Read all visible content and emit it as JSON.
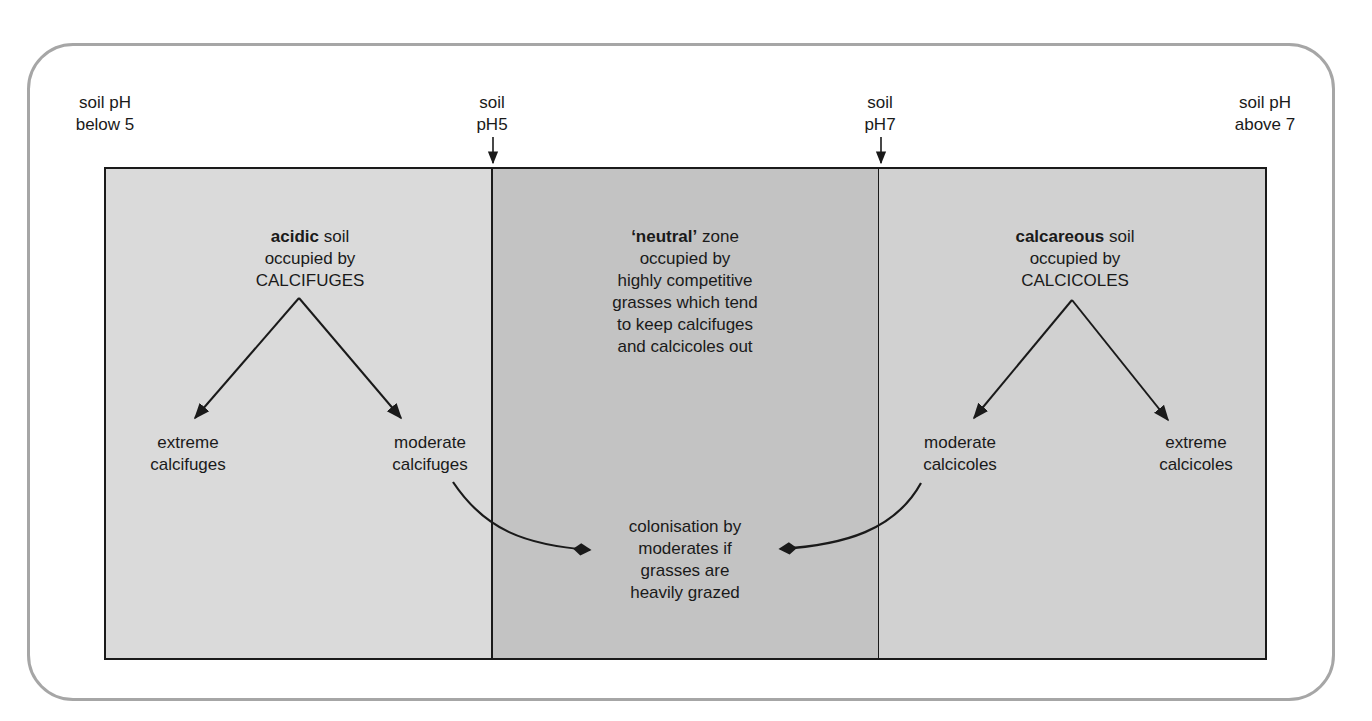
{
  "diagram": {
    "top_labels": {
      "below5": [
        "soil pH",
        "below 5"
      ],
      "ph5": [
        "soil",
        "pH5"
      ],
      "ph7": [
        "soil",
        "pH7"
      ],
      "above7": [
        "soil pH",
        "above 7"
      ]
    },
    "zones": {
      "acidic": {
        "heading_bold": "acidic",
        "heading_rest": " soil",
        "lines": [
          "occupied by",
          "CALCIFUGES"
        ],
        "children": {
          "left": [
            "extreme",
            "calcifuges"
          ],
          "right": [
            "moderate",
            "calcifuges"
          ]
        },
        "fill": "#dadada"
      },
      "neutral": {
        "heading_bold": "‘neutral’",
        "heading_rest": " zone",
        "lines": [
          "occupied by",
          "highly competitive",
          "grasses which tend",
          "to keep calcifuges",
          "and calcicoles out"
        ],
        "colonisation": [
          "colonisation by",
          "moderates if",
          "grasses are",
          "heavily grazed"
        ],
        "fill": "#c3c3c3"
      },
      "calcareous": {
        "heading_bold": "calcareous",
        "heading_rest": " soil",
        "lines": [
          "occupied by",
          "CALCICOLES"
        ],
        "children": {
          "left": [
            "moderate",
            "calcicoles"
          ],
          "right": [
            "extreme",
            "calcicoles"
          ]
        },
        "fill": "#d1d1d1"
      }
    },
    "colors": {
      "frame": "#a6a6a6",
      "line": "#1a1a1a"
    }
  }
}
